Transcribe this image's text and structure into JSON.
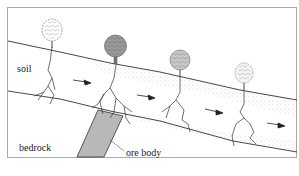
{
  "diagram": {
    "labels": {
      "soil": "soil",
      "bedrock": "bedrock",
      "ore_body": "ore body"
    },
    "trees": [
      {
        "id": "tree-1",
        "state": "healthy",
        "fill": "#ffffff"
      },
      {
        "id": "tree-2",
        "state": "affected",
        "fill": "#9a9a9a"
      },
      {
        "id": "tree-3",
        "state": "partially-affected",
        "fill": "#c8c8c8"
      },
      {
        "id": "tree-4",
        "state": "healthy",
        "fill": "#f4f4f4"
      }
    ],
    "arrows_direction": "downslope",
    "colors": {
      "line": "#333333",
      "ore_body_fill": "#b8b8b8",
      "frame": "#aaaaaa",
      "stipple": "#999999"
    }
  }
}
